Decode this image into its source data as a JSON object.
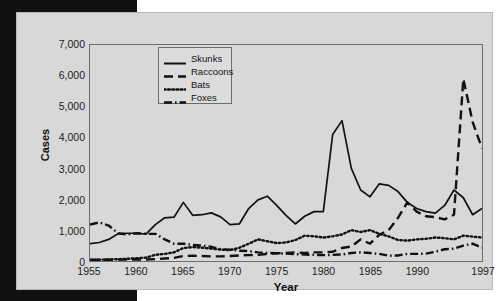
{
  "chart_data": {
    "type": "line",
    "title": "",
    "xlabel": "Year",
    "ylabel": "Cases",
    "xlim": [
      1955,
      1997
    ],
    "ylim": [
      0,
      7000
    ],
    "grid": false,
    "legend_position": "top-left-inside",
    "xtick_labels": [
      "1955",
      "1960",
      "1965",
      "1970",
      "1975",
      "1980",
      "1985",
      "1990",
      "1997"
    ],
    "xtick_values": [
      1955,
      1960,
      1965,
      1970,
      1975,
      1980,
      1985,
      1990,
      1997
    ],
    "ytick_labels": [
      "0",
      "1,000",
      "2,000",
      "3,000",
      "4,000",
      "5,000",
      "6,000",
      "7,000"
    ],
    "ytick_values": [
      0,
      1000,
      2000,
      3000,
      4000,
      5000,
      6000,
      7000
    ],
    "x": [
      1955,
      1956,
      1957,
      1958,
      1959,
      1960,
      1961,
      1962,
      1963,
      1964,
      1965,
      1966,
      1967,
      1968,
      1969,
      1970,
      1971,
      1972,
      1973,
      1974,
      1975,
      1976,
      1977,
      1978,
      1979,
      1980,
      1981,
      1982,
      1983,
      1984,
      1985,
      1986,
      1987,
      1988,
      1989,
      1990,
      1991,
      1992,
      1993,
      1994,
      1995,
      1996,
      1997
    ],
    "series": [
      {
        "name": "Skunks",
        "style": "solid",
        "color": "#111111",
        "values": [
          560,
          600,
          700,
          880,
          900,
          900,
          870,
          1180,
          1400,
          1420,
          1900,
          1480,
          1500,
          1560,
          1430,
          1180,
          1200,
          1700,
          1980,
          2100,
          1800,
          1480,
          1200,
          1450,
          1600,
          1600,
          4100,
          4550,
          3000,
          2300,
          2080,
          2500,
          2450,
          2250,
          1900,
          1700,
          1600,
          1550,
          1800,
          2300,
          2050,
          1500,
          1700
        ]
      },
      {
        "name": "Raccoons",
        "style": "dashed",
        "color": "#111111",
        "values": [
          40,
          40,
          40,
          45,
          45,
          50,
          50,
          60,
          80,
          100,
          160,
          170,
          160,
          150,
          150,
          160,
          180,
          190,
          200,
          230,
          250,
          260,
          280,
          260,
          280,
          280,
          300,
          420,
          470,
          700,
          560,
          850,
          1000,
          1400,
          1900,
          1600,
          1450,
          1420,
          1350,
          1500,
          5900,
          4500,
          3650
        ]
      },
      {
        "name": "Bats",
        "style": "dotted",
        "color": "#111111",
        "values": [
          30,
          40,
          50,
          60,
          70,
          90,
          110,
          200,
          230,
          280,
          420,
          450,
          430,
          400,
          370,
          350,
          430,
          560,
          700,
          640,
          580,
          600,
          680,
          820,
          800,
          760,
          800,
          860,
          1000,
          940,
          1000,
          880,
          800,
          680,
          660,
          700,
          720,
          760,
          740,
          700,
          820,
          790,
          760
        ]
      },
      {
        "name": "Foxes",
        "style": "dashdot",
        "color": "#111111",
        "values": [
          1180,
          1250,
          1150,
          900,
          860,
          900,
          880,
          880,
          700,
          560,
          560,
          520,
          500,
          460,
          380,
          370,
          330,
          320,
          280,
          260,
          250,
          240,
          220,
          210,
          200,
          190,
          200,
          210,
          260,
          280,
          260,
          230,
          170,
          180,
          230,
          230,
          240,
          300,
          380,
          400,
          500,
          560,
          430
        ]
      }
    ]
  }
}
